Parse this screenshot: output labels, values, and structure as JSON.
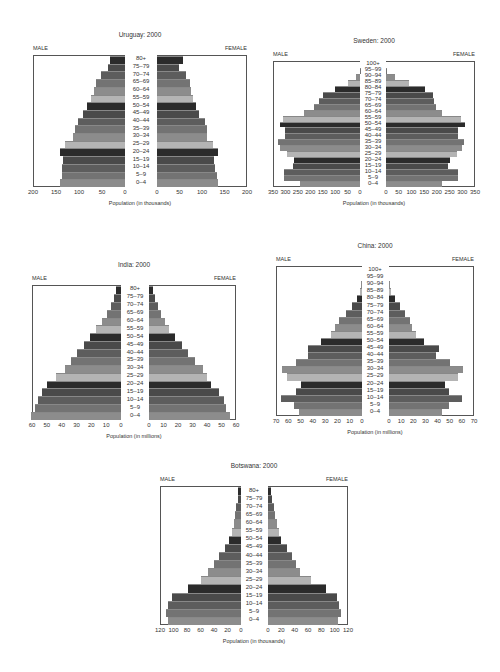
{
  "chart_data": [
    {
      "type": "bar",
      "subtype": "population-pyramid",
      "title": "Uruguay: 2000",
      "left_label": "MALE",
      "right_label": "FEMALE",
      "xlabel": "Population (in thousands)",
      "xlim": [
        0,
        200
      ],
      "ticks": [
        200,
        150,
        100,
        50,
        0
      ],
      "categories": [
        "80+",
        "75–79",
        "70–74",
        "65–69",
        "60–64",
        "55–59",
        "50–54",
        "45–49",
        "40–44",
        "35–39",
        "30–34",
        "25–29",
        "20–24",
        "15–19",
        "10–14",
        "5–9",
        "0–4"
      ],
      "series": [
        {
          "name": "MALE",
          "values": [
            33,
            37,
            53,
            63,
            68,
            75,
            83,
            92,
            102,
            109,
            113,
            131,
            142,
            135,
            136,
            138,
            141
          ]
        },
        {
          "name": "FEMALE",
          "values": [
            57,
            48,
            65,
            73,
            76,
            80,
            87,
            94,
            106,
            111,
            111,
            125,
            135,
            127,
            129,
            134,
            136
          ]
        }
      ],
      "box": {
        "top": 55,
        "height": 132,
        "male_left": 33,
        "male_right": 125,
        "female_left": 157,
        "female_right": 247,
        "label_center": 141
      }
    },
    {
      "type": "bar",
      "subtype": "population-pyramid",
      "title": "Sweden: 2000",
      "left_label": "MALE",
      "right_label": "FEMALE",
      "xlabel": "Population (in thousands)",
      "xlim": [
        0,
        350
      ],
      "ticks": [
        350,
        300,
        250,
        200,
        150,
        100,
        50,
        0
      ],
      "categories": [
        "100+",
        "95–99",
        "90–94",
        "85–89",
        "80–84",
        "75–79",
        "70–74",
        "65–69",
        "60–64",
        "55–59",
        "50–54",
        "45–49",
        "40–44",
        "35–39",
        "30–34",
        "25–29",
        "20–24",
        "15–19",
        "10–14",
        "5–9",
        "0–4"
      ],
      "series": [
        {
          "name": "MALE",
          "values": [
            0,
            2,
            15,
            48,
            100,
            148,
            165,
            185,
            225,
            310,
            320,
            300,
            300,
            330,
            320,
            295,
            265,
            270,
            305,
            305,
            240
          ]
        },
        {
          "name": "FEMALE",
          "values": [
            0,
            5,
            35,
            90,
            155,
            185,
            190,
            195,
            220,
            295,
            310,
            285,
            285,
            305,
            300,
            280,
            250,
            245,
            285,
            285,
            220
          ]
        }
      ],
      "box": {
        "top": 61,
        "height": 126,
        "male_left": 273,
        "male_right": 360,
        "female_left": 386,
        "female_right": 475,
        "label_center": 373
      }
    },
    {
      "type": "bar",
      "subtype": "population-pyramid",
      "title": "India: 2000",
      "left_label": "MALE",
      "right_label": "FEMALE",
      "xlabel": "Population (in millions)",
      "xlim": [
        0,
        60
      ],
      "ticks": [
        60,
        50,
        40,
        30,
        20,
        10,
        0
      ],
      "categories": [
        "80+",
        "75–79",
        "70–74",
        "65–69",
        "60–64",
        "55–59",
        "50–54",
        "45–49",
        "40–44",
        "35–39",
        "30–34",
        "25–29",
        "20–24",
        "15–19",
        "10–14",
        "5–9",
        "0–4"
      ],
      "series": [
        {
          "name": "MALE",
          "values": [
            3.5,
            5,
            7,
            9.5,
            13,
            17,
            21,
            25,
            30,
            33.5,
            38,
            44,
            50,
            53,
            56,
            58,
            61
          ]
        },
        {
          "name": "FEMALE",
          "values": [
            2.5,
            4,
            6.5,
            8,
            11,
            14,
            18,
            23,
            27,
            32,
            37,
            40,
            43,
            48,
            52,
            53,
            56
          ]
        }
      ],
      "box": {
        "top": 285,
        "height": 135,
        "male_left": 32,
        "male_right": 121,
        "female_left": 149,
        "female_right": 236,
        "label_center": 135
      }
    },
    {
      "type": "bar",
      "subtype": "population-pyramid",
      "title": "China: 2000",
      "left_label": "MALE",
      "right_label": "FEMALE",
      "xlabel": "Population (in millions)",
      "xlim": [
        0,
        70
      ],
      "ticks": [
        70,
        60,
        50,
        40,
        30,
        20,
        10,
        0
      ],
      "categories": [
        "100+",
        "95–99",
        "90–94",
        "85–89",
        "80–84",
        "75–79",
        "70–74",
        "65–69",
        "60–64",
        "55–59",
        "50–54",
        "45–49",
        "40–44",
        "35–39",
        "30–34",
        "25–29",
        "20–24",
        "15–19",
        "10–14",
        "5–9",
        "0–4"
      ],
      "series": [
        {
          "name": "MALE",
          "values": [
            0,
            0,
            0.5,
            2,
            4,
            8,
            13,
            19,
            22,
            25,
            33,
            44,
            44,
            54,
            65,
            61,
            50,
            54,
            66,
            55,
            51
          ]
        },
        {
          "name": "FEMALE",
          "values": [
            0,
            0,
            0.8,
            2,
            5,
            9,
            13,
            17,
            19,
            22,
            29,
            41,
            39,
            50,
            61,
            57,
            46,
            49,
            60,
            49,
            44
          ]
        }
      ],
      "box": {
        "top": 266,
        "height": 150,
        "male_left": 276,
        "male_right": 362,
        "female_left": 389,
        "female_right": 474,
        "label_center": 375
      }
    },
    {
      "type": "bar",
      "subtype": "population-pyramid",
      "title": "Botswana: 2000",
      "left_label": "MALE",
      "right_label": "FEMALE",
      "xlabel": "Population (in thousands)",
      "xlim": [
        0,
        120
      ],
      "ticks": [
        120,
        100,
        80,
        60,
        40,
        20,
        0
      ],
      "categories": [
        "80+",
        "75–79",
        "70–74",
        "65–69",
        "60–64",
        "55–59",
        "50–54",
        "45–49",
        "40–44",
        "35–39",
        "30–34",
        "25–29",
        "20–24",
        "15–19",
        "10–14",
        "5–9",
        "0–4"
      ],
      "series": [
        {
          "name": "MALE",
          "values": [
            4,
            5,
            7,
            9,
            11,
            14,
            18,
            23,
            32,
            40,
            49,
            59,
            79,
            102,
            108,
            111,
            108
          ]
        },
        {
          "name": "FEMALE",
          "values": [
            5,
            6,
            9,
            11,
            14,
            16,
            20,
            28,
            36,
            42,
            48,
            65,
            87,
            104,
            107,
            109,
            105
          ]
        }
      ],
      "box": {
        "top": 486,
        "height": 139,
        "male_left": 160,
        "male_right": 241,
        "female_left": 268,
        "female_right": 348,
        "label_center": 254
      }
    }
  ],
  "shades": [
    "#2b2b2b",
    "#4a4a4a",
    "#5d5d5d",
    "#737373",
    "#8c8c8c",
    "#b4b4b4"
  ]
}
